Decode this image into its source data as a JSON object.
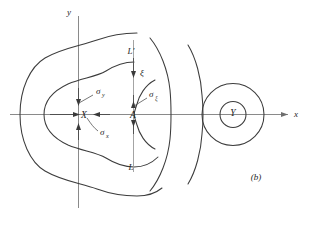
{
  "figure": {
    "caption": "(b)",
    "axes": {
      "x_label": "x",
      "y_label": "y"
    },
    "points": [
      {
        "id": "X",
        "label": "X"
      },
      {
        "id": "A",
        "label": "A"
      },
      {
        "id": "Y",
        "label": "Y"
      }
    ],
    "curve_labels": [
      {
        "id": "L-prime",
        "label": "L′"
      },
      {
        "id": "L",
        "label": "L"
      }
    ],
    "field_labels": [
      {
        "id": "xi",
        "label": "ξ"
      },
      {
        "id": "sigma-y",
        "base": "σ",
        "sub": "y"
      },
      {
        "id": "sigma-x",
        "base": "σ",
        "sub": "x"
      },
      {
        "id": "sigma-xi",
        "base": "σ",
        "sub": "ξ"
      }
    ],
    "colors": {
      "curve": "#3c3c3c",
      "axis": "#8a8a8a",
      "arrow": "#3a3a3a",
      "text": "#252525",
      "background": "#ffffff"
    }
  }
}
